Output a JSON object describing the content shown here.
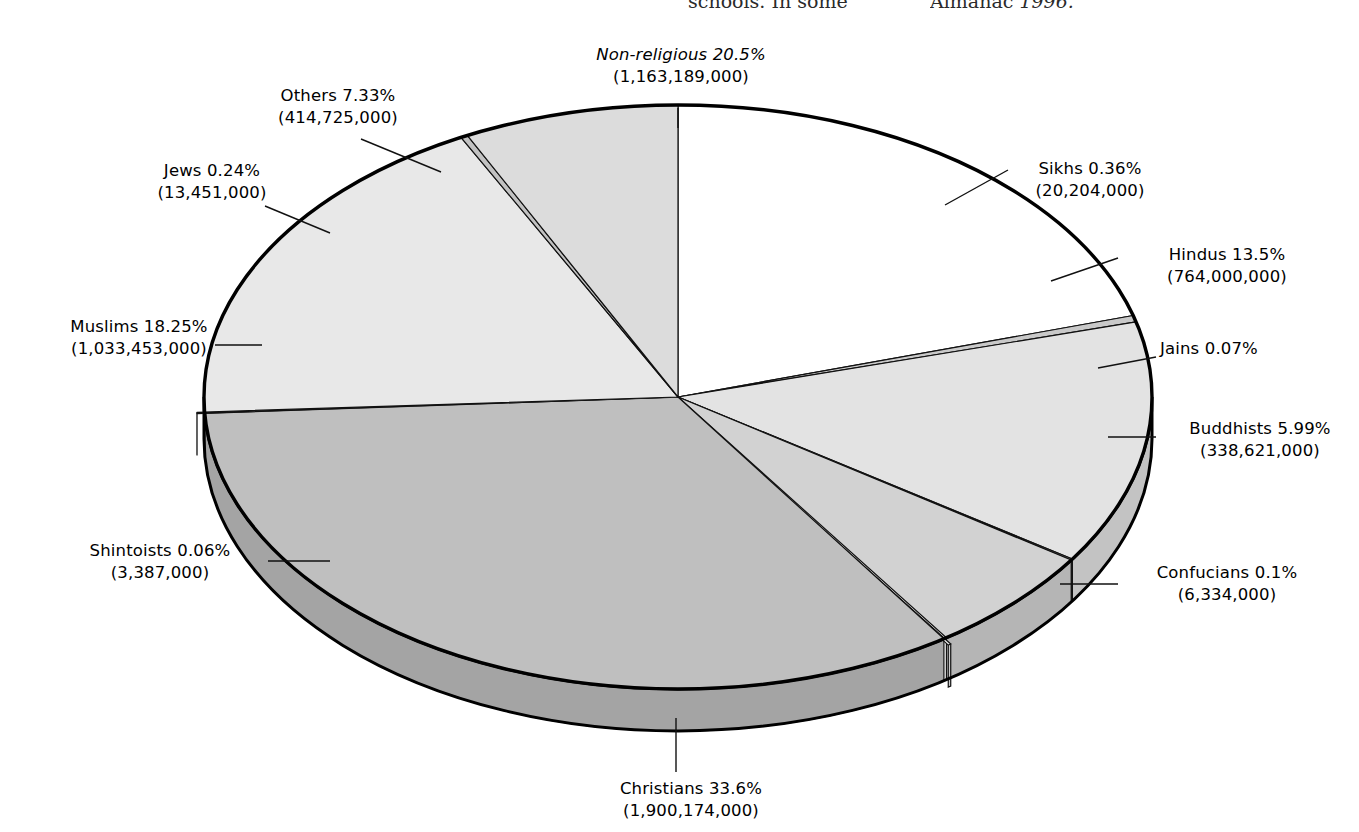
{
  "page_bleed": {
    "column_a": "schools. In some",
    "column_b_plain": "Almanac ",
    "column_b_italic": "1996."
  },
  "chart_data": {
    "type": "pie",
    "title": "",
    "subtitle": "",
    "legend_position": "callout-labels",
    "grid": false,
    "style": "3d-exploded-disc",
    "start_angle_deg": 0,
    "direction": "clockwise",
    "total_population": "5,657,538,000",
    "categories": [
      "Non-religious",
      "Sikhs",
      "Hindus",
      "Jains",
      "Buddhists",
      "Confucians",
      "Christians",
      "Shintoists",
      "Muslims",
      "Jews",
      "Others"
    ],
    "values": [
      20.5,
      0.36,
      13.5,
      0.07,
      5.99,
      0.1,
      33.6,
      0.06,
      18.25,
      0.24,
      7.33
    ],
    "counts": [
      "1,163,189,000",
      "20,204,000",
      "764,000,000",
      "",
      "338,621,000",
      "6,334,000",
      "1,900,174,000",
      "3,387,000",
      "1,033,453,000",
      "13,451,000",
      "414,725,000"
    ],
    "colors": [
      "#ffffff",
      "#c9c9c9",
      "#e3e3e3",
      "#b3b3b3",
      "#d2d2d2",
      "#ededed",
      "#bfbfbf",
      "#ededed",
      "#e8e8e8",
      "#c2c2c2",
      "#dcdcdc"
    ],
    "slices": [
      {
        "name": "Non-religious",
        "percent": "20.5%",
        "count": "(1,163,189,000)",
        "color": "#ffffff",
        "italic_name": true
      },
      {
        "name": "Sikhs",
        "percent": "0.36%",
        "count": "(20,204,000)",
        "color": "#c9c9c9",
        "italic_name": false
      },
      {
        "name": "Hindus",
        "percent": "13.5%",
        "count": "(764,000,000)",
        "color": "#e3e3e3",
        "italic_name": false
      },
      {
        "name": "Jains",
        "percent": "0.07%",
        "count": "",
        "color": "#b3b3b3",
        "italic_name": false
      },
      {
        "name": "Buddhists",
        "percent": "5.99%",
        "count": "(338,621,000)",
        "color": "#d2d2d2",
        "italic_name": false
      },
      {
        "name": "Confucians",
        "percent": "0.1%",
        "count": "(6,334,000)",
        "color": "#ededed",
        "italic_name": false
      },
      {
        "name": "Christians",
        "percent": "33.6%",
        "count": "(1,900,174,000)",
        "color": "#bfbfbf",
        "italic_name": false
      },
      {
        "name": "Shintoists",
        "percent": "0.06%",
        "count": "(3,387,000)",
        "color": "#ededed",
        "italic_name": false
      },
      {
        "name": "Muslims",
        "percent": "18.25%",
        "count": "(1,033,453,000)",
        "color": "#e8e8e8",
        "italic_name": false
      },
      {
        "name": "Jews",
        "percent": "0.24%",
        "count": "(13,451,000)",
        "color": "#c2c2c2",
        "italic_name": false
      },
      {
        "name": "Others",
        "percent": "7.33%",
        "count": "(414,725,000)",
        "color": "#dcdcdc",
        "italic_name": false
      }
    ]
  },
  "labels": {
    "nonreligious": {
      "name": "Non-religious",
      "percent": "20.5%",
      "count": "(1,163,189,000)"
    },
    "others": {
      "name": "Others",
      "percent": "7.33%",
      "count": "(414,725,000)"
    },
    "jews": {
      "name": "Jews",
      "percent": "0.24%",
      "count": "(13,451,000)"
    },
    "muslims": {
      "name": "Muslims",
      "percent": "18.25%",
      "count": "(1,033,453,000)"
    },
    "shintoists": {
      "name": "Shintoists",
      "percent": "0.06%",
      "count": "(3,387,000)"
    },
    "christians": {
      "name": "Christians",
      "percent": "33.6%",
      "count": "(1,900,174,000)"
    },
    "confucians": {
      "name": "Confucians",
      "percent": "0.1%",
      "count": "(6,334,000)"
    },
    "buddhists": {
      "name": "Buddhists",
      "percent": "5.99%",
      "count": "(338,621,000)"
    },
    "jains": {
      "name": "Jains",
      "percent": "0.07%",
      "count": ""
    },
    "hindus": {
      "name": "Hindus",
      "percent": "13.5%",
      "count": "(764,000,000)"
    },
    "sikhs": {
      "name": "Sikhs",
      "percent": "0.36%",
      "count": "(20,204,000)"
    }
  },
  "label_lines": {
    "nonreligious_l1": "Non-religious  20.5%",
    "nonreligious_l2": "(1,163,189,000)",
    "others_l1": "Others  7.33%",
    "others_l2": "(414,725,000)",
    "jews_l1": "Jews  0.24%",
    "jews_l2": "(13,451,000)",
    "muslims_l1": "Muslims  18.25%",
    "muslims_l2": "(1,033,453,000)",
    "shintoists_l1": "Shintoists  0.06%",
    "shintoists_l2": "(3,387,000)",
    "christians_l1": "Christians  33.6%",
    "christians_l2": "(1,900,174,000)",
    "confucians_l1": "Confucians  0.1%",
    "confucians_l2": "(6,334,000)",
    "buddhists_l1": "Buddhists  5.99%",
    "buddhists_l2": "(338,621,000)",
    "jains_l1": "Jains  0.07%",
    "jains_l2": "",
    "hindus_l1": "Hindus  13.5%",
    "hindus_l2": "(764,000,000)",
    "sikhs_l1": "Sikhs  0.36%",
    "sikhs_l2": "(20,204,000)"
  }
}
